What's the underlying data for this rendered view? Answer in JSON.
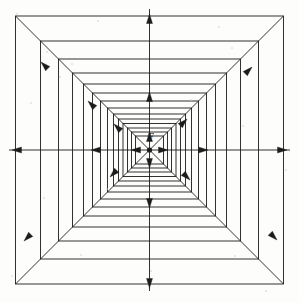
{
  "figure": {
    "center_label": "F",
    "background_color": "#fdfdfc",
    "stroke_color": "#1c1c1c",
    "line_width": 0.9
  },
  "chart_data": {
    "type": "diagram",
    "center": {
      "x": 149.5,
      "y": 150.0,
      "label": "F",
      "dot_radius": 2.6
    },
    "squares": [
      {
        "index": 0,
        "half_size": 134.0,
        "x0": 15.5,
        "y0": 16.0,
        "x1": 283.5,
        "y1": 284.0
      },
      {
        "index": 1,
        "half_size": 109.0,
        "x0": 40.5,
        "y0": 41.0,
        "x1": 258.5,
        "y1": 259.0
      },
      {
        "index": 2,
        "half_size": 91.0,
        "x0": 58.5,
        "y0": 59.0,
        "x1": 240.5,
        "y1": 241.0
      },
      {
        "index": 3,
        "half_size": 77.0,
        "x0": 72.5,
        "y0": 73.0,
        "x1": 226.5,
        "y1": 227.0
      },
      {
        "index": 4,
        "half_size": 66.0,
        "x0": 83.5,
        "y0": 84.0,
        "x1": 215.5,
        "y1": 216.0
      },
      {
        "index": 5,
        "half_size": 57.0,
        "x0": 92.5,
        "y0": 93.0,
        "x1": 206.5,
        "y1": 207.0
      },
      {
        "index": 6,
        "half_size": 49.0,
        "x0": 100.5,
        "y0": 101.0,
        "x1": 198.5,
        "y1": 199.0
      },
      {
        "index": 7,
        "half_size": 42.0,
        "x0": 107.5,
        "y0": 108.0,
        "x1": 191.5,
        "y1": 192.0
      },
      {
        "index": 8,
        "half_size": 36.0,
        "x0": 113.5,
        "y0": 114.0,
        "x1": 185.5,
        "y1": 186.0
      },
      {
        "index": 9,
        "half_size": 31.0,
        "x0": 118.5,
        "y0": 119.0,
        "x1": 180.5,
        "y1": 181.0
      },
      {
        "index": 10,
        "half_size": 26.5,
        "x0": 123.0,
        "y0": 123.5,
        "x1": 176.0,
        "y1": 176.5
      },
      {
        "index": 11,
        "half_size": 22.0,
        "x0": 127.5,
        "y0": 128.0,
        "x1": 171.5,
        "y1": 172.0
      },
      {
        "index": 12,
        "half_size": 18.0,
        "x0": 131.5,
        "y0": 132.0,
        "x1": 167.5,
        "y1": 168.0
      },
      {
        "index": 13,
        "half_size": 14.0,
        "x0": 135.5,
        "y0": 136.0,
        "x1": 163.5,
        "y1": 164.0
      }
    ],
    "square_count": 14,
    "diagonals": [
      {
        "name": "up-left",
        "from": [
          149.5,
          150.0
        ],
        "to": [
          15.5,
          16.0
        ]
      },
      {
        "name": "up-right",
        "from": [
          149.5,
          150.0
        ],
        "to": [
          283.5,
          16.0
        ]
      },
      {
        "name": "down-left",
        "from": [
          149.5,
          150.0
        ],
        "to": [
          15.5,
          284.0
        ]
      },
      {
        "name": "down-right",
        "from": [
          149.5,
          150.0
        ],
        "to": [
          283.5,
          284.0
        ]
      }
    ],
    "axis_rays": [
      {
        "name": "left",
        "from": [
          149.5,
          150.0
        ],
        "to": [
          9.0,
          150.0
        ]
      },
      {
        "name": "right",
        "from": [
          149.5,
          150.0
        ],
        "to": [
          290.0,
          150.0
        ]
      },
      {
        "name": "up",
        "from": [
          149.5,
          150.0
        ],
        "to": [
          149.5,
          9.0
        ]
      },
      {
        "name": "down",
        "from": [
          149.5,
          150.0
        ],
        "to": [
          149.5,
          291.0
        ]
      }
    ],
    "arrowheads": [
      {
        "axis": "left",
        "tip": [
          12.0,
          150.0
        ],
        "direction": "west"
      },
      {
        "axis": "left",
        "tip": [
          91.0,
          150.0
        ],
        "direction": "west"
      },
      {
        "axis": "left",
        "tip": [
          131.0,
          150.0
        ],
        "direction": "west"
      },
      {
        "axis": "right",
        "tip": [
          287.0,
          150.0
        ],
        "direction": "east"
      },
      {
        "axis": "right",
        "tip": [
          208.0,
          150.0
        ],
        "direction": "east"
      },
      {
        "axis": "right",
        "tip": [
          168.0,
          150.0
        ],
        "direction": "east"
      },
      {
        "axis": "up",
        "tip": [
          149.5,
          14.0
        ],
        "direction": "north"
      },
      {
        "axis": "up",
        "tip": [
          149.5,
          92.0
        ],
        "direction": "north"
      },
      {
        "axis": "up",
        "tip": [
          149.5,
          132.0
        ],
        "direction": "north"
      },
      {
        "axis": "down",
        "tip": [
          149.5,
          288.0
        ],
        "direction": "south"
      },
      {
        "axis": "down",
        "tip": [
          149.5,
          208.0
        ],
        "direction": "south"
      },
      {
        "axis": "down",
        "tip": [
          149.5,
          168.0
        ],
        "direction": "south"
      },
      {
        "axis": "up-left",
        "tip": [
          41.0,
          62.0
        ],
        "direction": "northwest"
      },
      {
        "axis": "up-left",
        "tip": [
          88.0,
          101.0
        ],
        "direction": "northwest"
      },
      {
        "axis": "up-left",
        "tip": [
          114.0,
          124.0
        ],
        "direction": "northwest"
      },
      {
        "axis": "up-right",
        "tip": [
          252.0,
          67.0
        ],
        "direction": "northeast"
      },
      {
        "axis": "up-right",
        "tip": [
          187.0,
          119.0
        ],
        "direction": "northeast"
      },
      {
        "axis": "down-left",
        "tip": [
          24.0,
          241.0
        ],
        "direction": "southwest"
      },
      {
        "axis": "down-left",
        "tip": [
          110.0,
          177.0
        ],
        "direction": "southwest"
      },
      {
        "axis": "down-right",
        "tip": [
          277.0,
          240.0
        ],
        "direction": "southeast"
      },
      {
        "axis": "down-right",
        "tip": [
          190.0,
          180.0
        ],
        "direction": "southeast"
      }
    ],
    "grid": false,
    "legend": false,
    "xlabel": "",
    "ylabel": ""
  },
  "specks": [
    {
      "x": 17,
      "y": 14,
      "r": 1.1
    },
    {
      "x": 72,
      "y": 64,
      "r": 1.0
    },
    {
      "x": 60,
      "y": 77,
      "r": 0.9
    },
    {
      "x": 47,
      "y": 52,
      "r": 0.8
    },
    {
      "x": 31,
      "y": 103,
      "r": 0.9
    },
    {
      "x": 232,
      "y": 48,
      "r": 0.9
    },
    {
      "x": 219,
      "y": 27,
      "r": 0.8
    },
    {
      "x": 243,
      "y": 126,
      "r": 0.8
    },
    {
      "x": 98,
      "y": 21,
      "r": 0.7
    },
    {
      "x": 191,
      "y": 100,
      "r": 0.7
    },
    {
      "x": 81,
      "y": 255,
      "r": 0.9
    },
    {
      "x": 235,
      "y": 256,
      "r": 0.8
    },
    {
      "x": 151,
      "y": 271,
      "r": 0.7
    },
    {
      "x": 12,
      "y": 276,
      "r": 0.9
    },
    {
      "x": 266,
      "y": 291,
      "r": 0.8
    },
    {
      "x": 107,
      "y": 189,
      "r": 0.7
    },
    {
      "x": 44,
      "y": 198,
      "r": 0.7
    },
    {
      "x": 286,
      "y": 170,
      "r": 0.7
    }
  ]
}
